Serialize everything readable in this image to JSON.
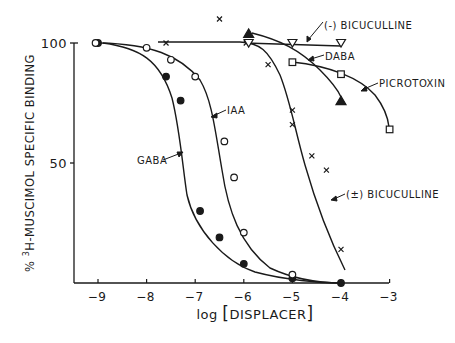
{
  "chart_data": {
    "type": "line",
    "title": "",
    "xlabel": "log [DISPLACER]",
    "ylabel": "% 3H-MUSCIMOL SPECIFIC BINDING",
    "ylabel_parts": {
      "prefix": "% ",
      "superscript": "3",
      "rest": "H-MUSCIMOL SPECIFIC BINDING"
    },
    "xlabel_parts": {
      "prefix": "log ",
      "open": "[",
      "inner": "DISPLACER",
      "close": "]"
    },
    "xlim": [
      -9.5,
      -3
    ],
    "ylim": [
      0,
      100
    ],
    "x_ticks": [
      -9,
      -8,
      -7,
      -6,
      -5,
      -4,
      -3
    ],
    "x_tick_labels": [
      "-9",
      "-8",
      "-7",
      "-6",
      "-5",
      "-4",
      "-3"
    ],
    "y_ticks": [
      50,
      100
    ],
    "y_tick_labels": [
      "50",
      "100"
    ],
    "grid": false,
    "legend": "inline annotations with arrows",
    "series": [
      {
        "name": "GABA",
        "marker": "filled-circle",
        "points": [
          [
            -9,
            100
          ],
          [
            -7.6,
            86
          ],
          [
            -7.3,
            76
          ],
          [
            -6.9,
            30
          ],
          [
            -6.5,
            19
          ],
          [
            -6,
            8
          ],
          [
            -5,
            2
          ],
          [
            -4,
            0
          ]
        ]
      },
      {
        "name": "IAA",
        "marker": "open-circle",
        "points": [
          [
            -9.05,
            100
          ],
          [
            -8,
            98
          ],
          [
            -7.5,
            93
          ],
          [
            -7,
            86
          ],
          [
            -6.4,
            59
          ],
          [
            -6.2,
            44
          ],
          [
            -6,
            21
          ],
          [
            -5,
            3.5
          ]
        ]
      },
      {
        "name": "(±) BICUCULLINE",
        "marker": "x",
        "points": [
          [
            -7.6,
            100
          ],
          [
            -6.5,
            110
          ],
          [
            -5.95,
            100
          ],
          [
            -5.5,
            91
          ],
          [
            -5,
            72
          ],
          [
            -5,
            66
          ],
          [
            -4.6,
            53
          ],
          [
            -4.3,
            47
          ],
          [
            -4,
            14
          ]
        ]
      },
      {
        "name": "(-) BICUCULLINE",
        "marker": "open-triangle-down",
        "points": [
          [
            -5.9,
            100
          ],
          [
            -5,
            100
          ],
          [
            -4,
            100
          ]
        ]
      },
      {
        "name": "DABA",
        "marker": "open-square",
        "points": [
          [
            -5,
            92
          ],
          [
            -4,
            87
          ],
          [
            -3,
            64
          ]
        ]
      },
      {
        "name": "PICROTOXIN",
        "marker": "filled-triangle-up",
        "points": [
          [
            -5.9,
            104
          ],
          [
            -4,
            76
          ]
        ]
      }
    ],
    "annotations": [
      {
        "text": "GABA"
      },
      {
        "text": "IAA"
      },
      {
        "text": "(-) BICUCULLINE"
      },
      {
        "text": "DABA"
      },
      {
        "text": "PICROTOXIN"
      },
      {
        "text": "(±) BICUCULLINE"
      }
    ]
  },
  "colors": {
    "ink": "#1a1a1a",
    "background": "#ffffff"
  }
}
